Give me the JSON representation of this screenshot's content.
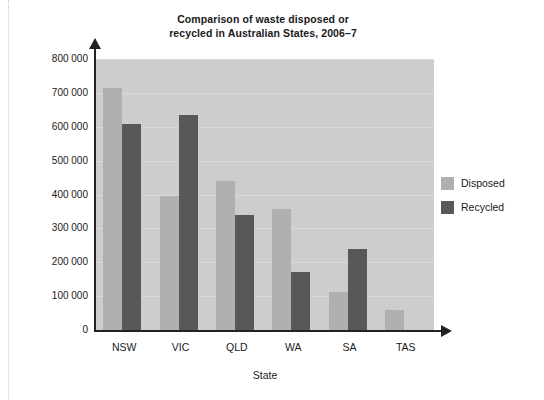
{
  "chart_data": {
    "type": "bar",
    "title": "Comparison of waste disposed or recycled in Australian States, 2006–7",
    "title_lines": [
      "Comparison of waste disposed or",
      "recycled in Australian States, 2006–7"
    ],
    "xlabel": "State",
    "ylabel": "",
    "categories": [
      "NSW",
      "VIC",
      "QLD",
      "WA",
      "SA",
      "TAS"
    ],
    "series": [
      {
        "name": "Disposed",
        "color": "#b0b0b0",
        "values": [
          715000,
          395000,
          440000,
          357000,
          112000,
          60000
        ]
      },
      {
        "name": "Recycled",
        "color": "#585858",
        "values": [
          608000,
          635000,
          340000,
          172000,
          240000,
          0
        ]
      }
    ],
    "ylim": [
      0,
      800000
    ],
    "ytick_values": [
      0,
      100000,
      200000,
      300000,
      400000,
      500000,
      600000,
      700000,
      800000
    ],
    "ytick_labels": [
      "0",
      "100 000",
      "200 000",
      "300 000",
      "400 000",
      "500 000",
      "600 000",
      "700 000",
      "800 000"
    ],
    "grid": true,
    "grid_axis": "y",
    "legend_position": "right",
    "plot_background": "#cdcdcd",
    "gridline_color": "#d9d9d9",
    "axis_color": "#222222",
    "page_background": "#ffffff"
  },
  "legend": {
    "items": [
      {
        "label": "Disposed",
        "color": "#b0b0b0"
      },
      {
        "label": "Recycled",
        "color": "#585858"
      }
    ]
  }
}
